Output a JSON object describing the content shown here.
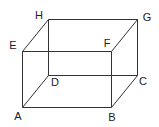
{
  "diagram": {
    "type": "cuboid",
    "vertices": [
      {
        "label": "A",
        "x": 22,
        "y": 107,
        "lx": 18,
        "ly": 120
      },
      {
        "label": "B",
        "x": 111,
        "y": 107,
        "lx": 112,
        "ly": 121
      },
      {
        "label": "C",
        "x": 137,
        "y": 75,
        "lx": 143,
        "ly": 85
      },
      {
        "label": "D",
        "x": 48,
        "y": 75,
        "lx": 55,
        "ly": 86
      },
      {
        "label": "E",
        "x": 22,
        "y": 51,
        "lx": 13,
        "ly": 49
      },
      {
        "label": "F",
        "x": 111,
        "y": 51,
        "lx": 107,
        "ly": 47
      },
      {
        "label": "G",
        "x": 137,
        "y": 19,
        "lx": 147,
        "ly": 21
      },
      {
        "label": "H",
        "x": 48,
        "y": 19,
        "lx": 39,
        "ly": 19
      }
    ],
    "edges": [
      [
        "A",
        "B"
      ],
      [
        "B",
        "C"
      ],
      [
        "C",
        "D"
      ],
      [
        "D",
        "A"
      ],
      [
        "E",
        "F"
      ],
      [
        "F",
        "G"
      ],
      [
        "G",
        "H"
      ],
      [
        "H",
        "E"
      ],
      [
        "A",
        "E"
      ],
      [
        "B",
        "F"
      ],
      [
        "C",
        "G"
      ],
      [
        "D",
        "H"
      ]
    ],
    "colors": {
      "line": "#333333",
      "text": "#222222",
      "background": "#ffffff"
    }
  }
}
